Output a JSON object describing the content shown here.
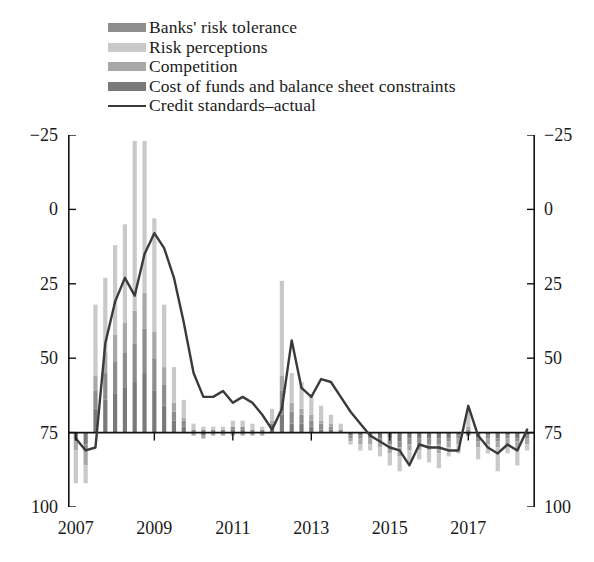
{
  "legend": {
    "items": [
      {
        "label": "Banks' risk tolerance",
        "swatch": "#8d8d8d",
        "type": "bar",
        "key": "banks_risk_tolerance"
      },
      {
        "label": "Risk perceptions",
        "swatch": "#c9c9c9",
        "type": "bar",
        "key": "risk_perceptions"
      },
      {
        "label": "Competition",
        "swatch": "#a8a8a8",
        "type": "bar",
        "key": "competition"
      },
      {
        "label": "Cost of funds and balance sheet constraints",
        "swatch": "#7a7a7a",
        "type": "bar",
        "key": "cost_of_funds"
      },
      {
        "label": "Credit standards–actual",
        "swatch": "#3a3a3a",
        "type": "line",
        "key": "credit_standards_actual"
      }
    ]
  },
  "axes": {
    "y_left_ticks": [
      "100",
      "75",
      "50",
      "25",
      "0",
      "−25"
    ],
    "y_right_ticks": [
      "100",
      "75",
      "50",
      "25",
      "0",
      "−25"
    ],
    "x_ticks": [
      "2007",
      "2009",
      "2011",
      "2013",
      "2015",
      "2017"
    ]
  },
  "chart_data": {
    "type": "bar",
    "title": "",
    "subtitle": "",
    "xlabel": "",
    "ylabel": "",
    "ylim": [
      -25,
      100
    ],
    "yticks": [
      -25,
      0,
      25,
      50,
      75,
      100
    ],
    "grid": false,
    "legend_position": "top-left",
    "stacked": true,
    "bar_colors": {
      "banks_risk_tolerance": "#8d8d8d",
      "risk_perceptions": "#c9c9c9",
      "competition": "#a8a8a8",
      "cost_of_funds": "#7a7a7a"
    },
    "line_color": "#3a3a3a",
    "x_tick_labels": [
      "2007",
      "2009",
      "2011",
      "2013",
      "2015",
      "2017"
    ],
    "x_tick_indices": [
      0,
      8,
      16,
      24,
      32,
      40
    ],
    "categories": [
      "2007Q1",
      "2007Q2",
      "2007Q3",
      "2007Q4",
      "2008Q1",
      "2008Q2",
      "2008Q3",
      "2008Q4",
      "2009Q1",
      "2009Q2",
      "2009Q3",
      "2009Q4",
      "2010Q1",
      "2010Q2",
      "2010Q3",
      "2010Q4",
      "2011Q1",
      "2011Q2",
      "2011Q3",
      "2011Q4",
      "2012Q1",
      "2012Q2",
      "2012Q3",
      "2012Q4",
      "2013Q1",
      "2013Q2",
      "2013Q3",
      "2013Q4",
      "2014Q1",
      "2014Q2",
      "2014Q3",
      "2014Q4",
      "2015Q1",
      "2015Q2",
      "2015Q3",
      "2015Q4",
      "2016Q1",
      "2016Q2",
      "2016Q3",
      "2016Q4",
      "2017Q1",
      "2017Q2",
      "2017Q3",
      "2017Q4",
      "2018Q1",
      "2018Q2",
      "2018Q3"
    ],
    "series": [
      {
        "name": "Cost of funds and balance sheet constraints",
        "values": [
          -2,
          -4,
          8,
          11,
          13,
          15,
          17,
          20,
          14,
          9,
          4,
          2,
          0,
          -1,
          0,
          0,
          1,
          1,
          0,
          0,
          1,
          6,
          3,
          3,
          2,
          1,
          1,
          0,
          -1,
          -1,
          -1,
          -2,
          -2,
          -3,
          -2,
          -2,
          -2,
          -2,
          -2,
          -1,
          -1,
          -2,
          -1,
          -2,
          -1,
          -2,
          -1
        ]
      },
      {
        "name": "Banks' risk tolerance",
        "values": [
          -1,
          -2,
          6,
          9,
          11,
          12,
          13,
          15,
          11,
          7,
          3,
          2,
          1,
          1,
          1,
          1,
          1,
          1,
          1,
          1,
          2,
          8,
          4,
          3,
          2,
          2,
          1,
          1,
          -1,
          -1,
          -1,
          -1,
          -2,
          -2,
          -2,
          -2,
          -2,
          -2,
          -1,
          -1,
          1,
          -1,
          -1,
          -1,
          -1,
          -1,
          -1
        ]
      },
      {
        "name": "Competition",
        "values": [
          -3,
          -5,
          5,
          7,
          9,
          10,
          11,
          12,
          9,
          6,
          3,
          1,
          -1,
          -1,
          -1,
          -1,
          -1,
          -1,
          -1,
          -1,
          1,
          5,
          3,
          2,
          2,
          1,
          1,
          0,
          -1,
          -2,
          -2,
          -2,
          -3,
          -3,
          -2,
          -2,
          -2,
          -3,
          -2,
          -2,
          1,
          -2,
          -2,
          -2,
          -2,
          -3,
          -2
        ]
      },
      {
        "name": "Risk perceptions",
        "values": [
          -11,
          -6,
          24,
          25,
          30,
          33,
          57,
          51,
          38,
          21,
          12,
          6,
          2,
          1,
          1,
          1,
          2,
          2,
          2,
          1,
          4,
          32,
          10,
          9,
          7,
          5,
          3,
          2,
          -1,
          -2,
          -2,
          -3,
          -4,
          -5,
          -4,
          -3,
          -4,
          -5,
          -3,
          -3,
          6,
          -4,
          -3,
          -8,
          -3,
          -5,
          -2
        ]
      }
    ],
    "line_series": {
      "name": "Credit standards–actual",
      "values": [
        -2,
        -6,
        -5,
        30,
        44,
        52,
        46,
        60,
        67,
        62,
        52,
        37,
        20,
        12,
        12,
        14,
        10,
        12,
        10,
        6,
        1,
        8,
        31,
        15,
        12,
        18,
        17,
        12,
        7,
        3,
        -1,
        -3,
        -5,
        -6,
        -11,
        -4,
        -5,
        -5,
        -6,
        -6,
        9,
        -1,
        -5,
        -7,
        -4,
        -6,
        1
      ]
    }
  }
}
